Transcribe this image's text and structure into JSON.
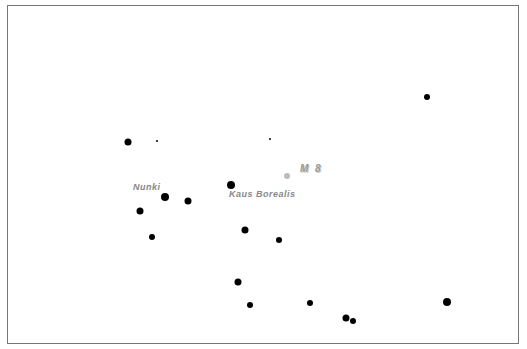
{
  "chart": {
    "frame_color": "#777777",
    "star_color": "#000000",
    "dso_color": "#bbbbbb",
    "label_color": "#888888"
  },
  "labels": {
    "nunki": "Nunki",
    "kaus_borealis": "Kaus  Borealis",
    "m8": "M 8"
  },
  "stars": [
    {
      "x": 128,
      "y": 142,
      "r": 3.5
    },
    {
      "x": 157,
      "y": 141,
      "r": 1
    },
    {
      "x": 270,
      "y": 139,
      "r": 1
    },
    {
      "x": 427,
      "y": 97,
      "r": 3
    },
    {
      "x": 165,
      "y": 197,
      "r": 4
    },
    {
      "x": 188,
      "y": 201,
      "r": 3.5
    },
    {
      "x": 140,
      "y": 211,
      "r": 3.5
    },
    {
      "x": 231,
      "y": 185,
      "r": 4
    },
    {
      "x": 152,
      "y": 237,
      "r": 3
    },
    {
      "x": 245,
      "y": 230,
      "r": 3.5
    },
    {
      "x": 279,
      "y": 240,
      "r": 3
    },
    {
      "x": 238,
      "y": 282,
      "r": 3.5
    },
    {
      "x": 250,
      "y": 305,
      "r": 3
    },
    {
      "x": 310,
      "y": 303,
      "r": 3
    },
    {
      "x": 346,
      "y": 318,
      "r": 3.5
    },
    {
      "x": 353,
      "y": 321,
      "r": 3
    },
    {
      "x": 447,
      "y": 302,
      "r": 4
    }
  ],
  "dso": [
    {
      "name": "M 8",
      "x": 287,
      "y": 176,
      "r": 3
    }
  ]
}
